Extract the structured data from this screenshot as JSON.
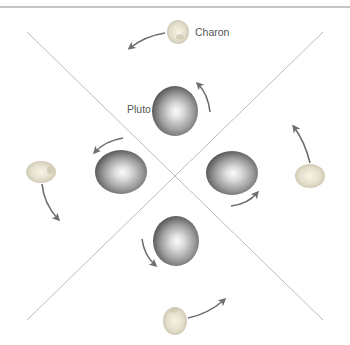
{
  "diagram": {
    "labels": {
      "charon": "Charon",
      "pluto": "Pluto"
    },
    "colors": {
      "background": "#ffffff",
      "rule": "#8a8a8a",
      "diagonal_lines": "#bdbdbd",
      "arrow": "#6e6e6e",
      "pluto_light": "#f4f4f4",
      "pluto_mid": "#a8a8a8",
      "pluto_dark": "#555555",
      "charon_light": "#f6f3e6",
      "charon_mid": "#dcd8c4",
      "charon_dark": "#b8b3a0",
      "label_text": "#555555"
    },
    "positions": [
      {
        "name": "top",
        "pluto": [
          175,
          110
        ],
        "charon": [
          178,
          32
        ]
      },
      {
        "name": "left",
        "pluto": [
          120,
          173
        ],
        "charon": [
          40,
          172
        ]
      },
      {
        "name": "right",
        "pluto": [
          232,
          173
        ],
        "charon": [
          310,
          177
        ]
      },
      {
        "name": "bottom",
        "pluto": [
          176,
          240
        ],
        "charon": [
          175,
          322
        ]
      }
    ]
  }
}
